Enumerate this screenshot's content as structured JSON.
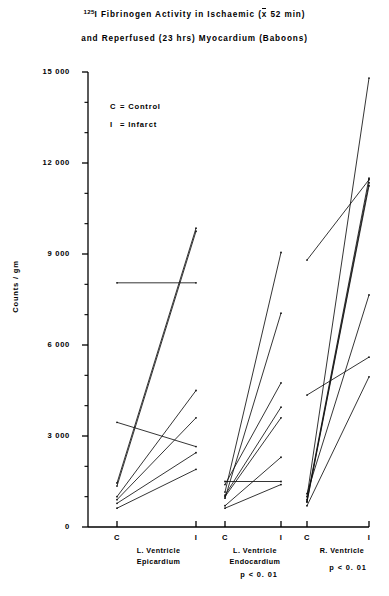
{
  "title": {
    "line1_pre_sup": "125",
    "line1": "I  Fibrinogen  Activity  in  Ischaemic  (x 52 min)",
    "line1_a": "I  Fibrinogen  Activity  in  Ischaemic  (",
    "line1_xbar": "x",
    "line1_b": " 52 min)",
    "line2": "and  Reperfused  (23 hrs)  Myocardium  (Baboons)"
  },
  "legend": {
    "items": [
      {
        "symbol": "C",
        "sep": "=",
        "label": "Control"
      },
      {
        "symbol": "I",
        "sep": "=",
        "label": "Infarct"
      }
    ]
  },
  "axes": {
    "ylabel": "Counts / gm",
    "ytick_labels": [
      "15 000",
      "12 000",
      "9 000",
      "6 000",
      "3 000",
      "0"
    ],
    "xtick_labels": [
      "C",
      "I",
      "C",
      "I",
      "C",
      "I"
    ]
  },
  "groups": [
    {
      "name": "L. Ventricle Epicardium",
      "label_line1": "L. Ventricle",
      "label_line2": "Epicardium",
      "pvalue": ""
    },
    {
      "name": "L. Ventricle Endocardium",
      "label_line1": "L. Ventricle",
      "label_line2": "Endocardium",
      "pvalue": "p < 0. 01"
    },
    {
      "name": "R. Ventricle",
      "label_line1": "R. Ventricle",
      "label_line2": "",
      "pvalue": "p < 0. 01"
    }
  ],
  "chart_data": {
    "type": "line",
    "subtype": "paired-slope-chart",
    "title": "125I Fibrinogen Activity in Ischaemic (x 52 min) and Reperfused (23 hrs) Myocardium (Baboons)",
    "xlabel": "",
    "ylabel": "Counts / gm",
    "ylim": [
      0,
      15000
    ],
    "ytick_values": [
      0,
      3000,
      6000,
      9000,
      12000,
      15000
    ],
    "yminor_step": 1000,
    "grid": false,
    "legend_position": "upper-left-inside",
    "categories": [
      "C",
      "I"
    ],
    "legend": [
      "C = Control",
      "I = Infarct"
    ],
    "groups": [
      {
        "name": "L. Ventricle Epicardium",
        "pvalue": null,
        "pairs": [
          {
            "control": 1450,
            "infarct": 9850
          },
          {
            "control": 1350,
            "infarct": 9750
          },
          {
            "control": 8050,
            "infarct": 8050
          },
          {
            "control": 3450,
            "infarct": 2650
          },
          {
            "control": 1000,
            "infarct": 4500
          },
          {
            "control": 900,
            "infarct": 3600
          },
          {
            "control": 780,
            "infarct": 2450
          },
          {
            "control": 620,
            "infarct": 1900
          }
        ]
      },
      {
        "name": "L. Ventricle Endocardium",
        "pvalue": "p < 0.01",
        "pairs": [
          {
            "control": 1150,
            "infarct": 9050
          },
          {
            "control": 950,
            "infarct": 7050
          },
          {
            "control": 1400,
            "infarct": 4750
          },
          {
            "control": 1050,
            "infarct": 3950
          },
          {
            "control": 1000,
            "infarct": 3600
          },
          {
            "control": 700,
            "infarct": 2300
          },
          {
            "control": 1500,
            "infarct": 1500
          },
          {
            "control": 620,
            "infarct": 1400
          }
        ]
      },
      {
        "name": "R. Ventricle",
        "pvalue": "p < 0.01",
        "pairs": [
          {
            "control": 1000,
            "infarct": 14800
          },
          {
            "control": 900,
            "infarct": 11500
          },
          {
            "control": 850,
            "infarct": 11350
          },
          {
            "control": 820,
            "infarct": 11250
          },
          {
            "control": 8800,
            "infarct": 11450
          },
          {
            "control": 1100,
            "infarct": 7650
          },
          {
            "control": 4350,
            "infarct": 5600
          },
          {
            "control": 700,
            "infarct": 4950
          }
        ]
      }
    ]
  },
  "plot_geometry": {
    "axis_left_x": 88,
    "axis_bottom_y": 527,
    "axis_top_y": 72,
    "x_positions": [
      117,
      196,
      225,
      304,
      333,
      412
    ],
    "x_positions_clamped": [
      117,
      196,
      225,
      281,
      307,
      369
    ]
  }
}
